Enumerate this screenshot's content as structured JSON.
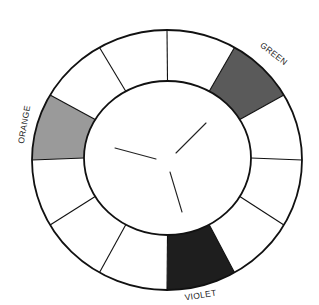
{
  "diagram": {
    "type": "color-wheel",
    "segment_count": 12,
    "start_angle_deg": 0,
    "angle_direction": "clockwise-from-top",
    "geometry": {
      "outer": {
        "cx": 167,
        "cy": 160,
        "rx": 135,
        "ry": 130
      },
      "inner": {
        "cx": 167.5,
        "cy": 158,
        "rx": 83.5,
        "ry": 77
      }
    },
    "segments": [
      {
        "index": 0,
        "from_deg": 0,
        "to_deg": 30,
        "fill": "#ffffff",
        "label": ""
      },
      {
        "index": 1,
        "from_deg": 30,
        "to_deg": 60,
        "fill": "#5a5a5a",
        "label": "GREEN"
      },
      {
        "index": 2,
        "from_deg": 60,
        "to_deg": 90,
        "fill": "#ffffff",
        "label": ""
      },
      {
        "index": 3,
        "from_deg": 90,
        "to_deg": 120,
        "fill": "#ffffff",
        "label": ""
      },
      {
        "index": 4,
        "from_deg": 120,
        "to_deg": 150,
        "fill": "#ffffff",
        "label": ""
      },
      {
        "index": 5,
        "from_deg": 150,
        "to_deg": 180,
        "fill": "#1e1e1e",
        "label": "VIOLET"
      },
      {
        "index": 6,
        "from_deg": 180,
        "to_deg": 210,
        "fill": "#ffffff",
        "label": ""
      },
      {
        "index": 7,
        "from_deg": 210,
        "to_deg": 240,
        "fill": "#ffffff",
        "label": ""
      },
      {
        "index": 8,
        "from_deg": 240,
        "to_deg": 270,
        "fill": "#ffffff",
        "label": ""
      },
      {
        "index": 9,
        "from_deg": 270,
        "to_deg": 300,
        "fill": "#9a9a9a",
        "label": "ORANGE"
      },
      {
        "index": 10,
        "from_deg": 300,
        "to_deg": 330,
        "fill": "#ffffff",
        "label": ""
      },
      {
        "index": 11,
        "from_deg": 330,
        "to_deg": 360,
        "fill": "#ffffff",
        "label": ""
      }
    ],
    "labels": [
      {
        "text": "GREEN",
        "x": 272,
        "y": 56,
        "rotate": 38
      },
      {
        "text": "ORANGE",
        "x": 27,
        "y": 125,
        "rotate": -80
      },
      {
        "text": "VIOLET",
        "x": 201,
        "y": 298,
        "rotate": -9
      }
    ],
    "hub_lines": [
      {
        "x1": 115,
        "y1": 148,
        "x2": 156,
        "y2": 159
      },
      {
        "x1": 176,
        "y1": 153,
        "x2": 206,
        "y2": 123
      },
      {
        "x1": 170,
        "y1": 172,
        "x2": 182,
        "y2": 212
      }
    ],
    "colors": {
      "stroke": "#111111",
      "background": "#ffffff",
      "green_shade": "#5a5a5a",
      "orange_shade": "#9a9a9a",
      "violet_shade": "#1e1e1e"
    }
  }
}
